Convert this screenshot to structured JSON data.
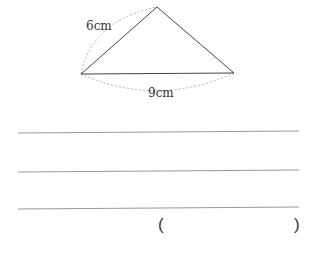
{
  "figure": {
    "shape": "triangle",
    "side_label": "6cm",
    "base_label": "9cm",
    "vertices": {
      "apex": [
        157,
        7
      ],
      "left": [
        81,
        74
      ],
      "right": [
        234,
        73
      ]
    }
  },
  "answer_lines": 3,
  "answer": {
    "open_paren": "(",
    "close_paren": ")",
    "value": ""
  }
}
